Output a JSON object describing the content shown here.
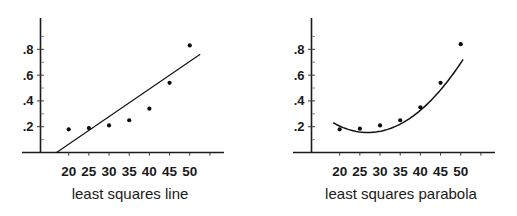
{
  "figure": {
    "background": "#ffffff",
    "ink_color": "#111111",
    "panel_count": 2
  },
  "chart_data": [
    {
      "type": "scatter",
      "title": "",
      "caption": "least squares line",
      "xlabel": "",
      "ylabel": "",
      "grid": false,
      "legend": null,
      "xlim": [
        15,
        57
      ],
      "ylim": [
        0,
        0.95
      ],
      "x_ticks": [
        20,
        25,
        30,
        35,
        40,
        45,
        50
      ],
      "x_tick_labels": [
        "20",
        "25",
        "30",
        "35",
        "40",
        "45",
        "50"
      ],
      "x_minor_ticks": [
        55
      ],
      "y_ticks": [
        0.2,
        0.4,
        0.6,
        0.8
      ],
      "y_tick_labels": [
        ".2",
        ".4",
        ".6",
        ".8"
      ],
      "y_minor_ticks": [
        0.1,
        0.3,
        0.5,
        0.7,
        0.9
      ],
      "x": [
        20,
        25,
        30,
        35,
        40,
        45,
        50
      ],
      "values": [
        0.18,
        0.19,
        0.21,
        0.25,
        0.34,
        0.54,
        0.83
      ],
      "fit": {
        "kind": "line",
        "label": "least squares line",
        "x_start": 17.0,
        "y_start": 0.0,
        "x_end": 52.5,
        "y_end": 0.76
      }
    },
    {
      "type": "scatter",
      "title": "",
      "caption": "least squares parabola",
      "xlabel": "",
      "ylabel": "",
      "grid": false,
      "legend": null,
      "xlim": [
        15,
        57
      ],
      "ylim": [
        0,
        0.95
      ],
      "x_ticks": [
        20,
        25,
        30,
        35,
        40,
        45,
        50
      ],
      "x_tick_labels": [
        "20",
        "25",
        "30",
        "35",
        "40",
        "45",
        "50"
      ],
      "x_minor_ticks": [
        55
      ],
      "y_ticks": [
        0.2,
        0.4,
        0.6,
        0.8
      ],
      "y_tick_labels": [
        ".2",
        ".4",
        ".6",
        ".8"
      ],
      "y_minor_ticks": [
        0.1,
        0.3,
        0.5,
        0.7,
        0.9
      ],
      "x": [
        20,
        25,
        30,
        35,
        40,
        45,
        50
      ],
      "values": [
        0.18,
        0.185,
        0.21,
        0.25,
        0.35,
        0.54,
        0.84
      ],
      "fit": {
        "kind": "parabola",
        "label": "least squares parabola",
        "x_start": 18.5,
        "x_end": 50.5,
        "vertex_x": 27.0,
        "vertex_y": 0.155,
        "curvature": 0.00102
      }
    }
  ]
}
